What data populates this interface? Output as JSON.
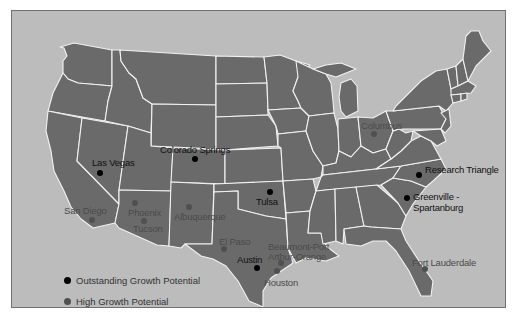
{
  "map": {
    "background_color": "#bcbcbc",
    "state_color": "#6a6a6a",
    "border_color": "#f2f2f2"
  },
  "legend": {
    "items": [
      {
        "label": "Outstanding Growth Potential",
        "color": "#000000"
      },
      {
        "label": "High Growth Potential",
        "color": "#505050"
      }
    ]
  },
  "cities": {
    "outstanding": [
      {
        "name": "Las Vegas",
        "dot": [
          100,
          173
        ],
        "label": [
          92,
          158
        ]
      },
      {
        "name": "Colorado Springs",
        "dot": [
          195,
          159
        ],
        "label": [
          160,
          145
        ]
      },
      {
        "name": "Tulsa",
        "dot": [
          270,
          192
        ],
        "label": [
          256,
          197
        ]
      },
      {
        "name": "Austin",
        "dot": [
          257,
          268
        ],
        "label": [
          237,
          255
        ]
      },
      {
        "name": "Research Triangle",
        "dot": [
          419,
          175
        ],
        "label": [
          425,
          165
        ]
      },
      {
        "name": "Greenville -",
        "dot": [
          407,
          198
        ],
        "label": [
          413,
          192
        ]
      },
      {
        "name": "Spartanburg",
        "dot": null,
        "label": [
          413,
          203
        ]
      }
    ],
    "high": [
      {
        "name": "San Diego",
        "dot": [
          92,
          220
        ],
        "label": [
          64,
          206
        ]
      },
      {
        "name": "Phoenix",
        "dot": [
          135,
          203
        ],
        "label": [
          128,
          208
        ]
      },
      {
        "name": "Tucson",
        "dot": [
          144,
          221
        ],
        "label": [
          133,
          224
        ]
      },
      {
        "name": "Albuquerque",
        "dot": [
          189,
          207
        ],
        "label": [
          174,
          212
        ]
      },
      {
        "name": "El Paso",
        "dot": [
          224,
          249
        ],
        "label": [
          219,
          237
        ]
      },
      {
        "name": "Beaumont-Port",
        "dot": [
          281,
          263
        ],
        "label": [
          268,
          242
        ]
      },
      {
        "name": "Arthur-Orange",
        "dot": null,
        "label": [
          268,
          252
        ]
      },
      {
        "name": "Houston",
        "dot": [
          277,
          271
        ],
        "label": [
          264,
          278
        ]
      },
      {
        "name": "Columbus",
        "dot": [
          374,
          134
        ],
        "label": [
          361,
          121
        ]
      },
      {
        "name": "Fort Lauderdale",
        "dot": [
          425,
          269
        ],
        "label": [
          412,
          258
        ]
      }
    ]
  }
}
